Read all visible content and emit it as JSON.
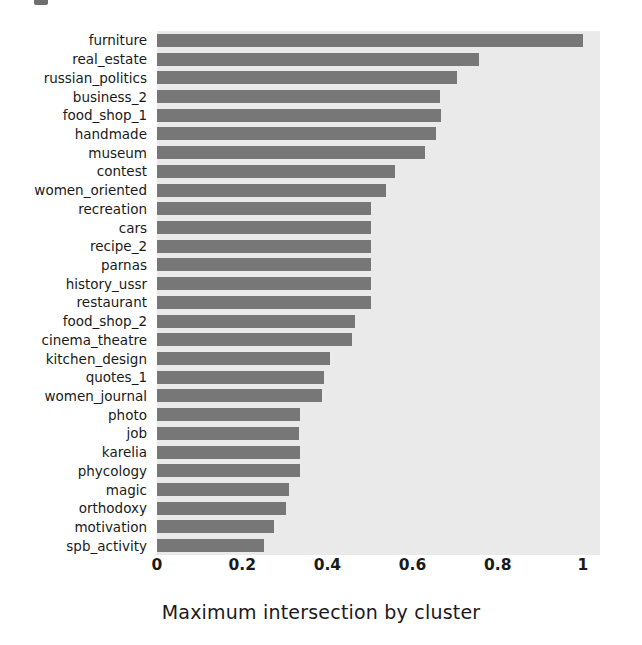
{
  "figure": {
    "background_color": "#ffffff",
    "plot_background_color": "#eaeaea",
    "bar_color": "#777777",
    "top_artifact_name": "clipped-figure-glyph"
  },
  "chart_data": {
    "type": "bar",
    "orientation": "horizontal",
    "title": "",
    "xlabel": "Maximum intersection by cluster",
    "ylabel": "",
    "xlim": [
      0,
      1.04
    ],
    "xticks": [
      "0",
      "0.2",
      "0.4",
      "0.6",
      "0.8",
      "1"
    ],
    "xtick_values": [
      0,
      0.2,
      0.4,
      0.6,
      0.8,
      1
    ],
    "grid": false,
    "legend": null,
    "categories": [
      "furniture",
      "real_estate",
      "russian_politics",
      "business_2",
      "food_shop_1",
      "handmade",
      "museum",
      "contest",
      "women_oriented",
      "recreation",
      "cars",
      "recipe_2",
      "parnas",
      "history_ussr",
      "restaurant",
      "food_shop_2",
      "cinema_theatre",
      "kitchen_design",
      "quotes_1",
      "women_journal",
      "photo",
      "job",
      "karelia",
      "phycology",
      "magic",
      "orthodoxy",
      "motivation",
      "spb_activity"
    ],
    "values": [
      1.0,
      0.755,
      0.705,
      0.665,
      0.667,
      0.655,
      0.628,
      0.558,
      0.537,
      0.502,
      0.502,
      0.502,
      0.502,
      0.502,
      0.502,
      0.465,
      0.458,
      0.405,
      0.392,
      0.388,
      0.336,
      0.334,
      0.336,
      0.336,
      0.31,
      0.302,
      0.275,
      0.251
    ]
  }
}
